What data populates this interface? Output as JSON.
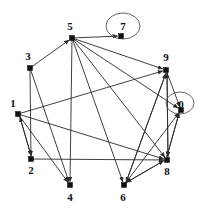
{
  "figure": {
    "width": 209,
    "height": 212,
    "background": "#ffffff",
    "edge_color": "#2a2a2a",
    "node_color": "#101010",
    "label_color": "#111111",
    "highlight_color": "#555555"
  },
  "nodes": [
    {
      "id": "0",
      "label": "0",
      "x": 181,
      "y": 110,
      "label_x": 181,
      "label_y": 105,
      "highlighted": true,
      "ellipse_cx": 180,
      "ellipse_cy": 103,
      "ellipse_rx": 14,
      "ellipse_ry": 11
    },
    {
      "id": "1",
      "label": "1",
      "x": 18,
      "y": 114,
      "label_x": 13,
      "label_y": 104,
      "highlighted": false
    },
    {
      "id": "2",
      "label": "2",
      "x": 31,
      "y": 159,
      "label_x": 31,
      "label_y": 171,
      "highlighted": false
    },
    {
      "id": "3",
      "label": "3",
      "x": 30,
      "y": 68,
      "label_x": 28,
      "label_y": 57,
      "highlighted": false
    },
    {
      "id": "4",
      "label": "4",
      "x": 70,
      "y": 185,
      "label_x": 70,
      "label_y": 198,
      "highlighted": false
    },
    {
      "id": "5",
      "label": "5",
      "x": 72,
      "y": 38,
      "label_x": 70,
      "label_y": 27,
      "highlighted": false
    },
    {
      "id": "6",
      "label": "6",
      "x": 124,
      "y": 185,
      "label_x": 123,
      "label_y": 198,
      "highlighted": false
    },
    {
      "id": "7",
      "label": "7",
      "x": 121,
      "y": 36,
      "label_x": 123,
      "label_y": 27,
      "highlighted": true,
      "ellipse_cx": 123,
      "ellipse_cy": 26,
      "ellipse_rx": 17,
      "ellipse_ry": 13
    },
    {
      "id": "8",
      "label": "8",
      "x": 167,
      "y": 160,
      "label_x": 167,
      "label_y": 172,
      "highlighted": false
    },
    {
      "id": "9",
      "label": "9",
      "x": 166,
      "y": 70,
      "label_x": 166,
      "label_y": 58,
      "highlighted": false
    }
  ],
  "edges": [
    {
      "from": "5",
      "to": "7",
      "arrow": true
    },
    {
      "from": "5",
      "to": "9",
      "arrow": true
    },
    {
      "from": "5",
      "to": "0",
      "arrow": true
    },
    {
      "from": "5",
      "to": "8",
      "arrow": true
    },
    {
      "from": "5",
      "to": "4",
      "arrow": true
    },
    {
      "from": "5",
      "to": "6",
      "arrow": true
    },
    {
      "from": "3",
      "to": "5",
      "arrow": true
    },
    {
      "from": "3",
      "to": "2",
      "arrow": true
    },
    {
      "from": "3",
      "to": "4",
      "arrow": true
    },
    {
      "from": "1",
      "to": "2",
      "arrow": true
    },
    {
      "from": "2",
      "to": "1",
      "arrow": true
    },
    {
      "from": "1",
      "to": "4",
      "arrow": true
    },
    {
      "from": "1",
      "to": "8",
      "arrow": true
    },
    {
      "from": "1",
      "to": "9",
      "arrow": true
    },
    {
      "from": "2",
      "to": "8",
      "arrow": true
    },
    {
      "from": "9",
      "to": "0",
      "arrow": true
    },
    {
      "from": "9",
      "to": "8",
      "arrow": true
    },
    {
      "from": "8",
      "to": "9",
      "arrow": true
    },
    {
      "from": "8",
      "to": "0",
      "arrow": true
    },
    {
      "from": "0",
      "to": "8",
      "arrow": true
    },
    {
      "from": "9",
      "to": "6",
      "arrow": true
    },
    {
      "from": "6",
      "to": "8",
      "arrow": true
    },
    {
      "from": "6",
      "to": "0",
      "arrow": true
    },
    {
      "from": "6",
      "to": "9",
      "arrow": true
    },
    {
      "from": "8",
      "to": "6",
      "arrow": true
    }
  ]
}
